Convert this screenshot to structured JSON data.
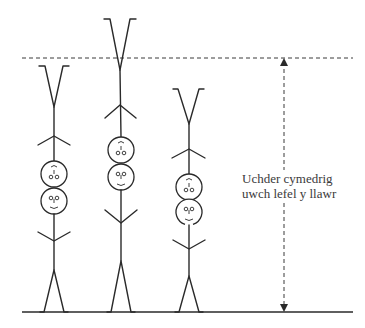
{
  "diagram": {
    "title": "",
    "annotation": {
      "line1": "Uchder cymedrig",
      "line2": "uwch lefel y llawr"
    },
    "reference_line": {
      "style": "dashed",
      "y": 58
    },
    "ground_line": {
      "y": 312
    },
    "figures": [
      {
        "id": "stack-1",
        "description": "Two stacked stick figures, upper one upside down",
        "top_y": 66
      },
      {
        "id": "stack-2",
        "description": "Two stacked stick figures, upper one upside down (tallest)",
        "top_y": 19
      },
      {
        "id": "stack-3",
        "description": "Two stacked stick figures, upper one upside down (shortest)",
        "top_y": 89
      }
    ],
    "colors": {
      "line": "#2a2a2a",
      "text": "#3a3a3a",
      "background": "#ffffff"
    }
  }
}
